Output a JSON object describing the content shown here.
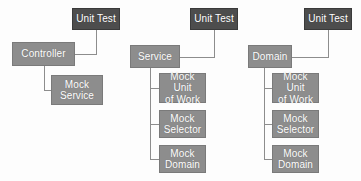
{
  "diagram": {
    "type": "tree",
    "colors": {
      "unit_test_box": "#4d4d4d",
      "component_box": "#8d8d8d",
      "connector": "#8d8d8d",
      "label_text": "#ffffff",
      "background": "#fdfdfd"
    },
    "groups": [
      {
        "id": "controller-group",
        "root": {
          "id": "controller",
          "label": "Controller",
          "style": "light"
        },
        "unit_test": {
          "id": "controller-unit-test",
          "label": "Unit Test",
          "style": "dark"
        },
        "mocks": [
          {
            "id": "mock-service",
            "label": "Mock\nService",
            "style": "light"
          }
        ]
      },
      {
        "id": "service-group",
        "root": {
          "id": "service",
          "label": "Service",
          "style": "light"
        },
        "unit_test": {
          "id": "service-unit-test",
          "label": "Unit Test",
          "style": "dark"
        },
        "mocks": [
          {
            "id": "service-mock-unit-of-work",
            "label": "Mock Unit\nof Work",
            "style": "light"
          },
          {
            "id": "service-mock-selector",
            "label": "Mock\nSelector",
            "style": "light"
          },
          {
            "id": "service-mock-domain",
            "label": "Mock\nDomain",
            "style": "light"
          }
        ]
      },
      {
        "id": "domain-group",
        "root": {
          "id": "domain",
          "label": "Domain",
          "style": "light"
        },
        "unit_test": {
          "id": "domain-unit-test",
          "label": "Unit Test",
          "style": "dark"
        },
        "mocks": [
          {
            "id": "domain-mock-unit-of-work",
            "label": "Mock Unit\nof Work",
            "style": "light"
          },
          {
            "id": "domain-mock-selector",
            "label": "Mock\nSelector",
            "style": "light"
          },
          {
            "id": "domain-mock-domain",
            "label": "Mock\nDomain",
            "style": "light"
          }
        ]
      }
    ]
  }
}
